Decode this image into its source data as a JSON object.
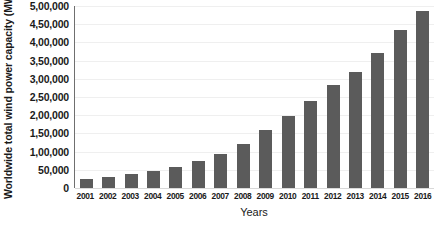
{
  "chart_data": {
    "type": "bar",
    "title": "",
    "xlabel": "Years",
    "ylabel": "Worldwide total wind power capacity (MW)",
    "categories": [
      "2001",
      "2002",
      "2003",
      "2004",
      "2005",
      "2006",
      "2007",
      "2008",
      "2009",
      "2010",
      "2011",
      "2012",
      "2013",
      "2014",
      "2015",
      "2016"
    ],
    "values": [
      24000,
      31000,
      39000,
      47000,
      59000,
      74000,
      94000,
      121000,
      159000,
      198000,
      238000,
      283000,
      318000,
      370000,
      433000,
      487000
    ],
    "ylim": [
      0,
      500000
    ],
    "ytick_values": [
      0,
      50000,
      100000,
      150000,
      200000,
      250000,
      300000,
      350000,
      400000,
      450000,
      500000
    ],
    "ytick_labels": [
      "0",
      "50,000",
      "1,00,000",
      "1,50,000",
      "2,00,000",
      "2,50,000",
      "3,00,000",
      "3,50,000",
      "4,00,000",
      "4,50,000",
      "5,00,000"
    ],
    "grid": true,
    "legend": "none",
    "bar_color": "#5b5b5b",
    "grid_color": "#efefef",
    "axis_color": "#6f6f6f",
    "background": "#ffffff"
  }
}
